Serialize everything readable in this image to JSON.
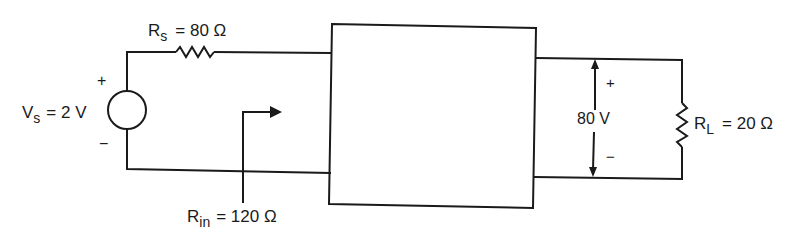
{
  "diagram": {
    "type": "circuit",
    "stroke_color": "#1a1a1a",
    "source": {
      "symbol": "V",
      "subscript": "s",
      "value": "= 2 V",
      "plus": "+",
      "minus": "−"
    },
    "source_resistor": {
      "symbol": "R",
      "subscript": "s",
      "value": "= 80 Ω"
    },
    "input_resistance": {
      "symbol": "R",
      "subscript": "in",
      "value": "= 120 Ω"
    },
    "output_voltage": {
      "value": "80 V",
      "plus": "+",
      "minus": "−"
    },
    "load_resistor": {
      "symbol": "R",
      "subscript": "L",
      "value": "= 20 Ω"
    },
    "amplifier_box": {
      "label": ""
    }
  }
}
